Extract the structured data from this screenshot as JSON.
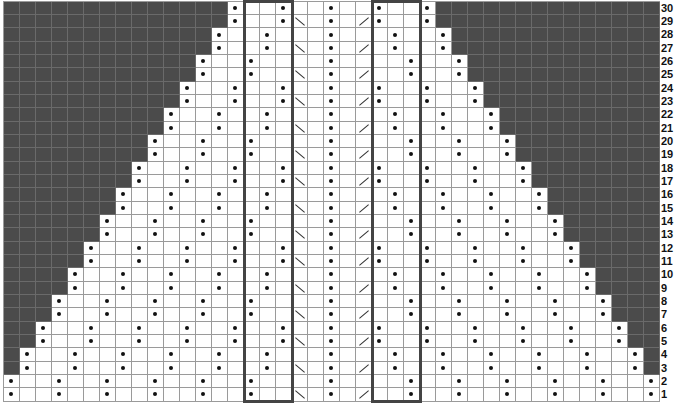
{
  "chart": {
    "type": "knitting-chart",
    "columns": 41,
    "rows": 30,
    "cell_width": 16,
    "cell_height": 13.33,
    "colors": {
      "no_stitch": "#4b4b4b",
      "grid": "#9a9a9a",
      "symbol": "#111111",
      "box_outline": "#444444"
    },
    "symbols": {
      "dot": "purl",
      "backslash": "left-leaning decrease",
      "slash": "right-leaning decrease",
      "dark": "no stitch"
    },
    "center_column": 20,
    "decrease_columns": {
      "backslash": 18,
      "slash": 22
    },
    "decrease_rows": "odd",
    "boxes": [
      {
        "name": "left-repeat-box",
        "col_start": 15,
        "col_end": 17
      },
      {
        "name": "right-repeat-box",
        "col_start": 23,
        "col_end": 25
      }
    ],
    "row_labels": [
      "1",
      "2",
      "3",
      "4",
      "5",
      "6",
      "7",
      "8",
      "9",
      "10",
      "11",
      "12",
      "13",
      "14",
      "15",
      "16",
      "17",
      "18",
      "19",
      "20",
      "21",
      "22",
      "23",
      "24",
      "25",
      "26",
      "27",
      "28",
      "29",
      "30"
    ]
  }
}
